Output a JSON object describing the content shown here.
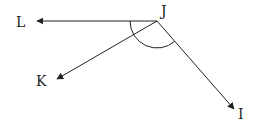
{
  "diagram": {
    "vertex": {
      "label": "J",
      "x": 157,
      "y": 21
    },
    "rays": [
      {
        "label": "L",
        "tip": [
          37,
          21
        ],
        "label_pos": [
          16,
          27
        ]
      },
      {
        "label": "K",
        "tip": [
          57,
          79
        ],
        "label_pos": [
          36,
          86
        ]
      },
      {
        "label": "I",
        "tip": [
          234,
          109
        ],
        "label_pos": [
          238,
          119
        ]
      }
    ],
    "angle_arc": {
      "from_ray": "L",
      "to_ray": "I",
      "radius": 27
    },
    "vertex_label_pos": [
      161,
      16
    ],
    "colors": {
      "stroke": "#222222",
      "background": "#ffffff"
    }
  }
}
